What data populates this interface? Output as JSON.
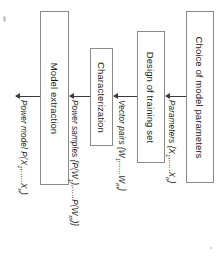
{
  "diagram": {
    "orientation": "rotated-90-clockwise",
    "stages": [
      {
        "id": "choice-of-model-parameters",
        "label": "Choice of model parameters"
      },
      {
        "id": "design-of-training-set",
        "label": "Design of training set"
      },
      {
        "id": "characterization",
        "label": "Characterization"
      },
      {
        "id": "model-extraction",
        "label": "Model extraction"
      }
    ],
    "flows": [
      {
        "id": "parameters",
        "label": "Parameters {X",
        "sub1": "1",
        "mid": ",.....X",
        "sub2": "n",
        "tail": "}"
      },
      {
        "id": "vector-pairs",
        "label": "Vector pairs {W",
        "sub1": "1",
        "mid": ",.....W",
        "sub2": "m",
        "tail": "}"
      },
      {
        "id": "power-samples",
        "label": "Power samples {P(W",
        "sub1": "1",
        "mid": "),.....P(W",
        "sub2": "m",
        "tail": ")}"
      },
      {
        "id": "power-model",
        "label": "Power model P(X",
        "sub1": "1",
        "mid": ",.....X",
        "sub2": "n",
        "tail": ")"
      }
    ],
    "colors": {
      "box_border": "#8a8a8a",
      "arrow": "#3a3a3a",
      "text": "#1a1a1a",
      "background": "#ffffff"
    }
  }
}
